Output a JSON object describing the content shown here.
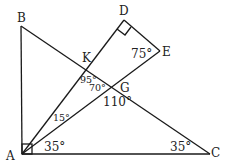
{
  "diagram": {
    "points": {
      "A": {
        "label": "A",
        "x": 23,
        "y": 153
      },
      "B": {
        "label": "B",
        "x": 21,
        "y": 26
      },
      "C": {
        "label": "C",
        "x": 210,
        "y": 153
      },
      "D": {
        "label": "D",
        "x": 124,
        "y": 20
      },
      "E": {
        "label": "E",
        "x": 160,
        "y": 50
      },
      "K": {
        "label": "K",
        "x": 86,
        "y": 68
      },
      "G": {
        "label": "G",
        "x": 115,
        "y": 87
      }
    },
    "segments": [
      "AB",
      "AC",
      "BC",
      "AD",
      "AE",
      "DE"
    ],
    "right_angles": [
      "BAC",
      "ADE"
    ],
    "angles": {
      "E": "75°",
      "AKG": "95°",
      "KGA": "70°",
      "AGC": "110°",
      "KAG": "15°",
      "GAC": "35°",
      "C": "35°"
    },
    "stroke_color": "#1a1a1a"
  }
}
